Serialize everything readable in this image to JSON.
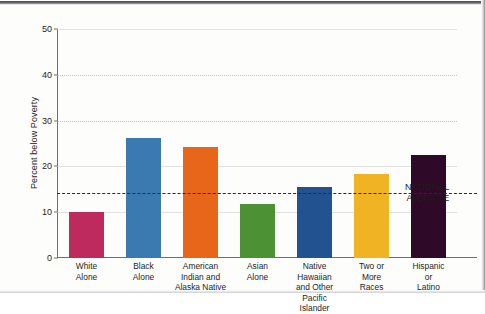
{
  "chart_data": {
    "type": "bar",
    "title": "",
    "xlabel": "",
    "ylabel": "Percent below Poverty",
    "ylim": [
      0,
      50
    ],
    "yticks": [
      0,
      10,
      20,
      30,
      40,
      50
    ],
    "ytick_labels": [
      "0",
      "10",
      "20",
      "30",
      "40",
      "50"
    ],
    "grid": true,
    "legend": false,
    "categories": [
      "White Alone",
      "Black Alone",
      "American Indian and Alaska Native",
      "Asian Alone",
      "Native Hawaiian and Other Pacific Islander",
      "Two or More Races",
      "Hispanic or Latino"
    ],
    "category_lines": [
      [
        "White",
        "Alone"
      ],
      [
        "Black",
        "Alone"
      ],
      [
        "American",
        "Indian and",
        "Alaska Native"
      ],
      [
        "Asian",
        "Alone"
      ],
      [
        "Native Hawaiian",
        "and Other",
        "Pacific Islander"
      ],
      [
        "Two or",
        "More",
        "Races"
      ],
      [
        "Hispanic",
        "or",
        "Latino"
      ]
    ],
    "values": [
      10.0,
      26.2,
      24.2,
      11.7,
      15.6,
      18.3,
      22.5
    ],
    "colors": [
      "#be2a5e",
      "#3a7ab0",
      "#e8661a",
      "#4c9134",
      "#22528f",
      "#f0b323",
      "#2e0a28"
    ],
    "annotations": [
      {
        "name": "national-average",
        "label_lines": [
          "NATIONAL",
          "AVERAGE"
        ],
        "label": "NATIONAL AVERAGE",
        "value": 14.3,
        "style": "dashed-horizontal-line",
        "color": "#2a2a2a"
      }
    ]
  }
}
